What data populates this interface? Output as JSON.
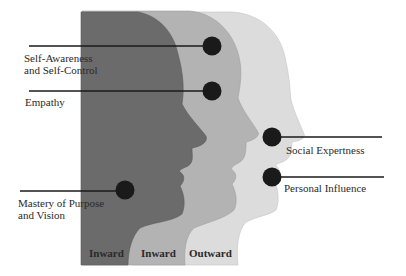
{
  "diagram": {
    "title": "",
    "colors": {
      "inward_dark": "#6b6b6b",
      "inward_medium": "#b3b3b3",
      "outward_light": "#dcdcdc",
      "marker": "#1a1a1a",
      "line": "#1a1a1a",
      "text": "#2a2a2a"
    },
    "heads": [
      {
        "id": "head-1",
        "label": "Inward",
        "shade": "dark"
      },
      {
        "id": "head-2",
        "label": "Inward",
        "shade": "medium"
      },
      {
        "id": "head-3",
        "label": "Outward",
        "shade": "light"
      }
    ],
    "callouts": [
      {
        "id": "self-awareness",
        "line1": "Self-Awareness",
        "line2": "and Self-Control",
        "head": "head-2"
      },
      {
        "id": "empathy",
        "line1": "Empathy",
        "line2": "",
        "head": "head-2"
      },
      {
        "id": "mastery",
        "line1": "Mastery of Purpose",
        "line2": "and Vision",
        "head": "head-1"
      },
      {
        "id": "social-expertness",
        "line1": "Social Expertness",
        "line2": "",
        "head": "head-3"
      },
      {
        "id": "personal-influence",
        "line1": "Personal Influence",
        "line2": "",
        "head": "head-3"
      }
    ]
  }
}
